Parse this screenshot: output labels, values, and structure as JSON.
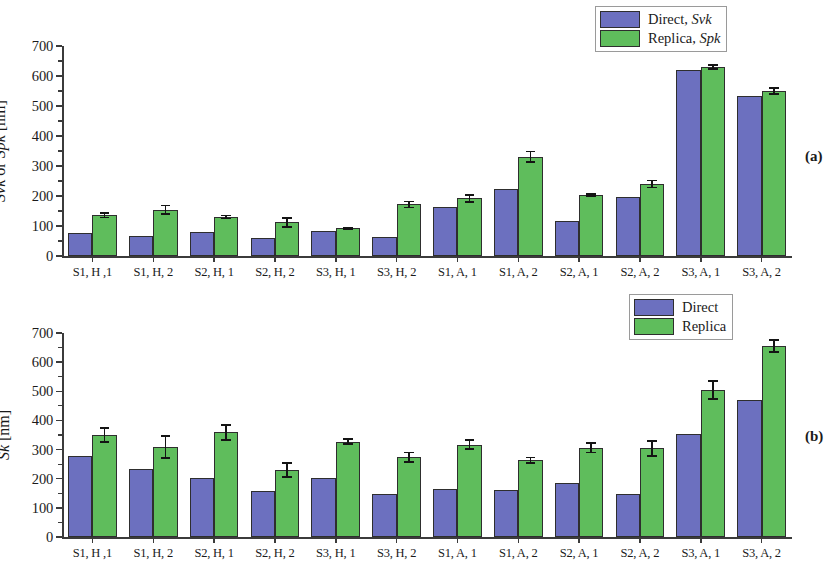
{
  "figure": {
    "panels": [
      {
        "tag": "(a)",
        "ylabel_plain": "Svk or Spk [nm]",
        "ylabel_parts": [
          {
            "text": "Svk",
            "italic": true
          },
          {
            "text": " or ",
            "italic": false
          },
          {
            "text": "Spk",
            "italic": true
          },
          {
            "text": " [nm]",
            "italic": false
          }
        ],
        "legend": [
          {
            "series": "Direct",
            "label_plain": "Direct, Svk",
            "prefix": "Direct, ",
            "symbol": "Svk",
            "color": "#6c70bf"
          },
          {
            "series": "Replica",
            "label_plain": "Replica, Spk",
            "prefix": "Replica, ",
            "symbol": "Spk",
            "color": "#5fbd5c"
          }
        ]
      },
      {
        "tag": "(b)",
        "ylabel_plain": "Sk [nm]",
        "ylabel_parts": [
          {
            "text": "Sk",
            "italic": true
          },
          {
            "text": " [nm]",
            "italic": false
          }
        ],
        "legend": [
          {
            "series": "Direct",
            "label_plain": "Direct",
            "prefix": "Direct",
            "symbol": "",
            "color": "#6c70bf"
          },
          {
            "series": "Replica",
            "label_plain": "Replica",
            "prefix": "Replica",
            "symbol": "",
            "color": "#5fbd5c"
          }
        ]
      }
    ]
  },
  "colors": {
    "direct": "#6c70bf",
    "replica": "#5fbd5c",
    "axis": "#3b3b3b",
    "error": "#141414",
    "background": "#ffffff"
  },
  "chart_data": [
    {
      "type": "bar",
      "panel": "(a)",
      "title": "",
      "xlabel": "",
      "ylabel": "Svk or Spk [nm]",
      "ylim": [
        0,
        700
      ],
      "yticks": [
        0,
        100,
        200,
        300,
        400,
        500,
        600,
        700
      ],
      "ytick_labels": [
        "0",
        "100",
        "200",
        "300",
        "400",
        "500",
        "600",
        "700"
      ],
      "minor_ticks": true,
      "grid": false,
      "legend_position": "top-right",
      "categories": [
        "S1, H ,1",
        "S1, H, 2",
        "S2, H, 1",
        "S2, H, 2",
        "S3, H, 1",
        "S3, H, 2",
        "S1, A, 1",
        "S1, A, 2",
        "S2, A, 1",
        "S2, A, 2",
        "S3, A, 1",
        "S3, A, 2"
      ],
      "series": [
        {
          "name": "Direct, Svk",
          "color": "#6c70bf",
          "values": [
            78,
            68,
            79,
            60,
            84,
            63,
            165,
            222,
            118,
            196,
            620,
            532
          ],
          "errors": [
            0,
            0,
            0,
            0,
            0,
            0,
            0,
            0,
            0,
            0,
            0,
            0
          ]
        },
        {
          "name": "Replica, Spk",
          "color": "#5fbd5c",
          "values": [
            136,
            154,
            130,
            112,
            92,
            172,
            192,
            331,
            203,
            240,
            630,
            550
          ],
          "errors": [
            8,
            14,
            5,
            15,
            3,
            10,
            12,
            17,
            3,
            12,
            6,
            9
          ]
        }
      ]
    },
    {
      "type": "bar",
      "panel": "(b)",
      "title": "",
      "xlabel": "",
      "ylabel": "Sk [nm]",
      "ylim": [
        0,
        700
      ],
      "yticks": [
        0,
        100,
        200,
        300,
        400,
        500,
        600,
        700
      ],
      "ytick_labels": [
        "0",
        "100",
        "200",
        "300",
        "400",
        "500",
        "600",
        "700"
      ],
      "minor_ticks": true,
      "grid": false,
      "legend_position": "top-right",
      "categories": [
        "S1, H ,1",
        "S1, H, 2",
        "S2, H, 1",
        "S2, H, 2",
        "S3, H, 1",
        "S3, H, 2",
        "S1, A, 1",
        "S1, A, 2",
        "S2, A, 1",
        "S2, A, 2",
        "S3, A, 1",
        "S3, A, 2"
      ],
      "series": [
        {
          "name": "Direct",
          "color": "#6c70bf",
          "values": [
            277,
            233,
            203,
            158,
            201,
            148,
            164,
            160,
            186,
            148,
            352,
            470
          ],
          "errors": [
            0,
            0,
            0,
            0,
            0,
            0,
            0,
            0,
            0,
            0,
            0,
            0
          ]
        },
        {
          "name": "Replica",
          "color": "#5fbd5c",
          "values": [
            350,
            309,
            359,
            230,
            327,
            274,
            317,
            264,
            306,
            304,
            504,
            656
          ],
          "errors": [
            24,
            38,
            25,
            23,
            9,
            16,
            15,
            9,
            16,
            26,
            31,
            20
          ]
        }
      ]
    }
  ]
}
